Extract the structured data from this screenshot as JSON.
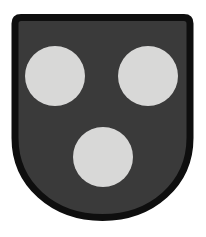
{
  "page": {
    "background_color": "#ffffff"
  },
  "coat_of_arms": {
    "field_color": "#3a3a3a",
    "border_color": "#0e0e0e",
    "roundel_color": "#d8d8d7",
    "roundels": [
      {
        "cx": 55,
        "cy": 76,
        "r": 30
      },
      {
        "cx": 148,
        "cy": 76,
        "r": 30
      },
      {
        "cx": 103,
        "cy": 157,
        "r": 30
      }
    ]
  }
}
